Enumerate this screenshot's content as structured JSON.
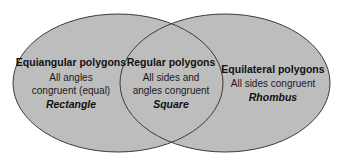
{
  "diagram": {
    "type": "venn",
    "colors": {
      "fill": "#bdbdbd",
      "outline": "#3a3a3a",
      "background": "#ffffff",
      "text": "#111111"
    },
    "sets": [
      {
        "id": "left",
        "title": "Equiangular polygons",
        "description_lines": [
          "All angles",
          "congruent (equal)"
        ],
        "example": "Rectangle"
      },
      {
        "id": "intersection",
        "title": "Regular polygons",
        "description_lines": [
          "All sides and",
          "angles congruent"
        ],
        "example": "Square"
      },
      {
        "id": "right",
        "title": "Equilateral polygons",
        "description_lines": [
          "All sides congruent"
        ],
        "example": "Rhombus"
      }
    ]
  }
}
